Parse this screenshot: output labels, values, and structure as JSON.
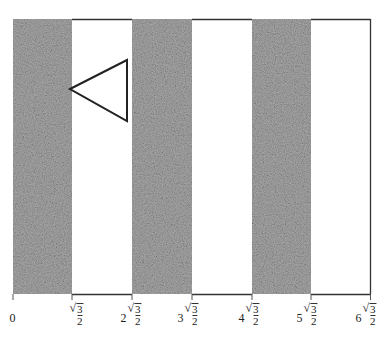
{
  "diagram": {
    "colors": {
      "shade": "#9a9a9a",
      "line": "#333333",
      "background": "#ffffff"
    },
    "bands": [
      {
        "from": 0,
        "to": 1,
        "shaded": true
      },
      {
        "from": 1,
        "to": 2,
        "shaded": false
      },
      {
        "from": 2,
        "to": 3,
        "shaded": true
      },
      {
        "from": 3,
        "to": 4,
        "shaded": false
      },
      {
        "from": 4,
        "to": 5,
        "shaded": true
      },
      {
        "from": 5,
        "to": 6,
        "shaded": false
      }
    ],
    "triangle": {
      "vertices_px": [
        [
          70,
          89
        ],
        [
          127,
          60
        ],
        [
          127,
          121
        ]
      ]
    },
    "axis_labels": [
      {
        "coef": "0",
        "radical": false
      },
      {
        "coef": "",
        "radical": true,
        "num": "3",
        "den": "2"
      },
      {
        "coef": "2",
        "radical": true,
        "num": "3",
        "den": "2"
      },
      {
        "coef": "3",
        "radical": true,
        "num": "3",
        "den": "2"
      },
      {
        "coef": "4",
        "radical": true,
        "num": "3",
        "den": "2"
      },
      {
        "coef": "5",
        "radical": true,
        "num": "3",
        "den": "2"
      },
      {
        "coef": "6",
        "radical": true,
        "num": "3",
        "den": "2"
      }
    ],
    "radical_symbol": "√"
  }
}
